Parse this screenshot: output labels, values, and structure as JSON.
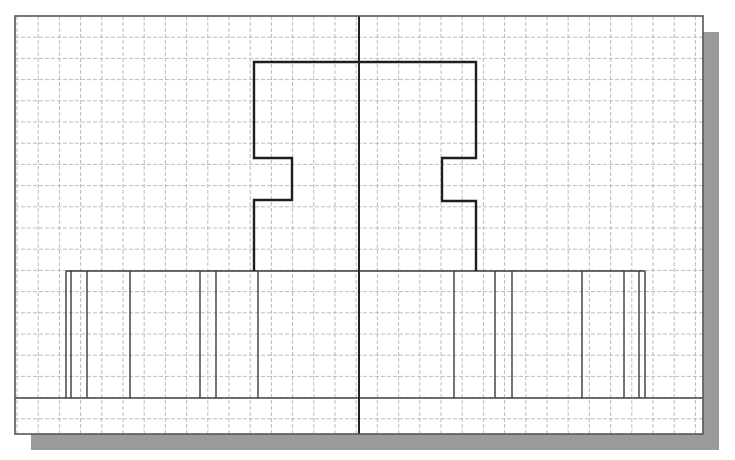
{
  "drawing": {
    "frame": {
      "x": 15,
      "y": 16,
      "width": 688,
      "height": 418,
      "stroke": "#555555"
    },
    "shadow": {
      "offset_x": 16,
      "offset_y": 16,
      "color": "#9a9a9a"
    },
    "grid": {
      "origin_x": 17,
      "origin_y": 16,
      "spacing": 21.2,
      "color": "#b5b5b5",
      "dash": "4 2"
    },
    "centerline": {
      "x": 359,
      "y1": 16,
      "y2": 434,
      "color": "#222222",
      "width": 2
    },
    "ground_line": {
      "y": 398,
      "x1": 15,
      "x2": 703,
      "color": "#444444",
      "width": 1.4
    },
    "profile": {
      "color": "#1e1e1e",
      "width": 2.4,
      "points": [
        [
          254,
          271
        ],
        [
          254,
          200
        ],
        [
          292,
          200
        ],
        [
          292,
          158
        ],
        [
          254,
          158
        ],
        [
          254,
          62
        ],
        [
          476,
          62
        ],
        [
          476,
          158
        ],
        [
          442,
          158
        ],
        [
          442,
          201
        ],
        [
          476,
          201
        ],
        [
          476,
          271
        ]
      ]
    },
    "base_band": {
      "x1": 66,
      "x2": 645,
      "y_top": 271,
      "y_bottom": 398,
      "color": "#3a3a3a",
      "width": 1.4,
      "vertical_lines_x": [
        66,
        71,
        87,
        130,
        200,
        216,
        258,
        454,
        495,
        512,
        582,
        624,
        639,
        645
      ]
    }
  }
}
